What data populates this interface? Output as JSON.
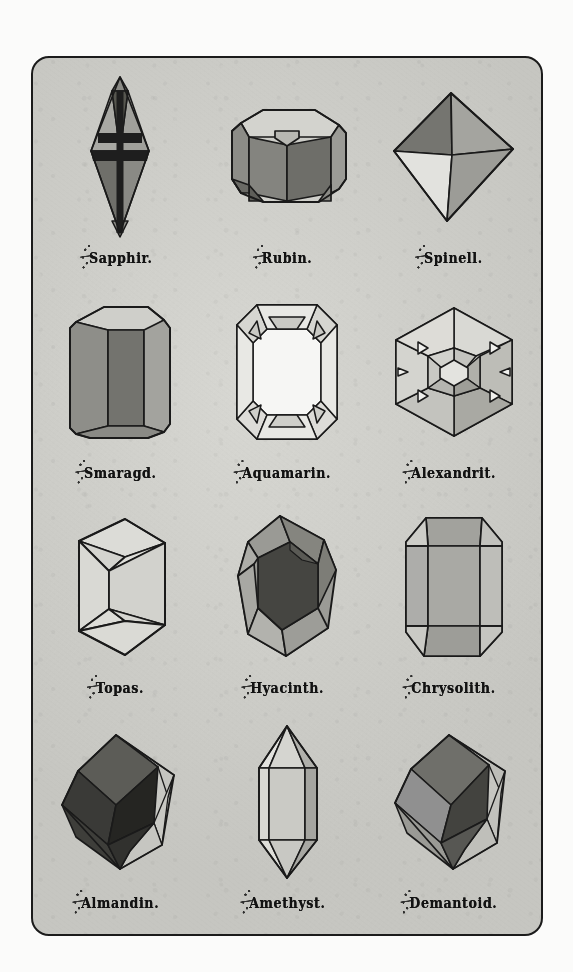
{
  "plate": {
    "title": "Gemstone crystal forms plate",
    "border_color": "#1b1b1b",
    "paper_color": "#cfcfca",
    "columns": 3,
    "rows": 4
  },
  "specimens": [
    {
      "id": "sapphir",
      "label": "Sapphir.",
      "initial": "S",
      "rest": "apphir.",
      "form": "bipyramid",
      "row": 1,
      "col": 1,
      "colors": {
        "light": "#a9a9a4",
        "mid": "#8b8b86",
        "dark": "#6f6f6a",
        "band": "#1e1e1e",
        "outline": "#1a1a1a"
      }
    },
    {
      "id": "rubin",
      "label": "Rubin.",
      "initial": "R",
      "rest": "ubin.",
      "form": "hexagonal-prism-tabular",
      "row": 1,
      "col": 2,
      "colors": {
        "light": "#cfcfc9",
        "mid": "#8c8c87",
        "dark": "#6e6e69",
        "band": "#5a5a55",
        "outline": "#1a1a1a"
      }
    },
    {
      "id": "spinell",
      "label": "Spinell.",
      "initial": "S",
      "rest": "pinell.",
      "form": "octahedron",
      "row": 1,
      "col": 3,
      "colors": {
        "light": "#d8d8d3",
        "mid": "#9c9c97",
        "dark": "#757570",
        "band": "#8a8a85",
        "outline": "#1a1a1a"
      }
    },
    {
      "id": "smaragd",
      "label": "Smaragd.",
      "initial": "S",
      "rest": "maragd.",
      "form": "hexagonal-prism-upright",
      "row": 2,
      "col": 1,
      "colors": {
        "light": "#a3a39e",
        "mid": "#8e8e89",
        "dark": "#737370",
        "band": "#9a9a95",
        "outline": "#1a1a1a"
      }
    },
    {
      "id": "aquamarin",
      "label": "Aquamarin.",
      "initial": "A",
      "rest": "quamarin.",
      "form": "emerald-cut",
      "row": 2,
      "col": 2,
      "colors": {
        "light": "#f2f2ef",
        "mid": "#e4e4e0",
        "dark": "#c9c9c4",
        "band": "#b4b4af",
        "outline": "#1a1a1a"
      }
    },
    {
      "id": "alexandrit",
      "label": "Alexandrit.",
      "initial": "A",
      "rest": "lexandrit.",
      "form": "hexagonal-star-cut-table",
      "row": 2,
      "col": 3,
      "colors": {
        "light": "#dcdcd7",
        "mid": "#b6b6b1",
        "dark": "#96968f",
        "band": "#c6c6c1",
        "outline": "#1a1a1a"
      }
    },
    {
      "id": "topas",
      "label": "Topas.",
      "initial": "T",
      "rest": "opas.",
      "form": "prism-beveled-ends",
      "row": 3,
      "col": 1,
      "colors": {
        "light": "#dedeD9",
        "mid": "#d2d2cd",
        "dark": "#c4c4bf",
        "band": "#cfcfca",
        "outline": "#1a1a1a"
      }
    },
    {
      "id": "hyacinth",
      "label": "Hyacinth.",
      "initial": "H",
      "rest": "yacinth.",
      "form": "beveled-dipyramid",
      "row": 3,
      "col": 2,
      "colors": {
        "light": "#a8a8a3",
        "mid": "#8f8f8a",
        "dark": "#4a4a46",
        "band": "#6d6d68",
        "outline": "#1a1a1a"
      }
    },
    {
      "id": "chrysolith",
      "label": "Chrysolith.",
      "initial": "C",
      "rest": "hrysolith.",
      "form": "orthorhombic-prism",
      "row": 3,
      "col": 3,
      "colors": {
        "light": "#d0d0cb",
        "mid": "#a6a6a1",
        "dark": "#8e8e89",
        "band": "#b8b8b3",
        "outline": "#1a1a1a"
      }
    },
    {
      "id": "almandin",
      "label": "Almandin.",
      "initial": "A",
      "rest": "lmandin.",
      "form": "rhombic-dodecahedron",
      "row": 4,
      "col": 1,
      "colors": {
        "light": "#9a9a95",
        "mid": "#6a6a65",
        "dark": "#3a3a37",
        "band": "#2c2c29",
        "outline": "#1a1a1a"
      }
    },
    {
      "id": "amethyst",
      "label": "Amethyst.",
      "initial": "A",
      "rest": "methyst.",
      "form": "quartz-doubly-terminated",
      "row": 4,
      "col": 2,
      "colors": {
        "light": "#dcdcd7",
        "mid": "#c2c2bd",
        "dark": "#a3a39e",
        "band": "#cccCC7",
        "outline": "#1a1a1a"
      }
    },
    {
      "id": "demantoid",
      "label": "Demantoid.",
      "initial": "D",
      "rest": "emantoid.",
      "form": "rhombic-dodecahedron",
      "row": 4,
      "col": 3,
      "colors": {
        "light": "#b0b0ab",
        "mid": "#808080",
        "dark": "#4e4e4a",
        "band": "#5c5c58",
        "outline": "#1a1a1a"
      }
    }
  ]
}
